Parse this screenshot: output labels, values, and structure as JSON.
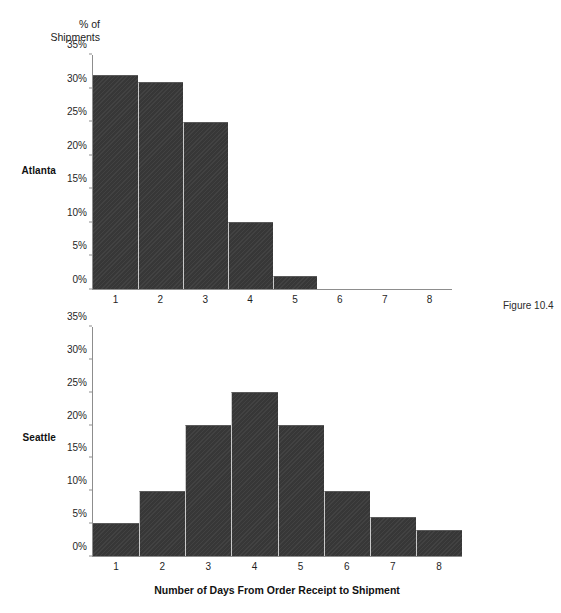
{
  "figure": {
    "caption": "Figure 10.4",
    "y_axis_title": "% of\nShipments",
    "x_axis_title": "Number of Days From Order Receipt to Shipment",
    "bar_color": "#3a3a3a",
    "axis_color": "#8d8d8d",
    "background": "#ffffff"
  },
  "panels": [
    {
      "label": "Atlanta"
    },
    {
      "label": "Seattle"
    }
  ],
  "chart_data": [
    {
      "type": "bar",
      "title": "Atlanta",
      "xlabel": "Number of Days From Order Receipt to Shipment",
      "ylabel": "% of Shipments",
      "categories": [
        "1",
        "2",
        "3",
        "4",
        "5",
        "6",
        "7",
        "8"
      ],
      "values": [
        32,
        31,
        25,
        10,
        2,
        0,
        0,
        0
      ],
      "ylim": [
        0,
        35
      ],
      "ytick_labels": [
        "0%",
        "5%",
        "10%",
        "15%",
        "20%",
        "25%",
        "30%",
        "35%"
      ],
      "ytick_values": [
        0,
        5,
        10,
        15,
        20,
        25,
        30,
        35
      ],
      "grid": false,
      "legend": "none"
    },
    {
      "type": "bar",
      "title": "Seattle",
      "xlabel": "Number of Days From Order Receipt to Shipment",
      "ylabel": "% of Shipments",
      "categories": [
        "1",
        "2",
        "3",
        "4",
        "5",
        "6",
        "7",
        "8"
      ],
      "values": [
        5,
        10,
        20,
        25,
        20,
        10,
        6,
        4
      ],
      "ylim": [
        0,
        35
      ],
      "ytick_labels": [
        "0%",
        "5%",
        "10%",
        "15%",
        "20%",
        "25%",
        "30%",
        "35%"
      ],
      "ytick_values": [
        0,
        5,
        10,
        15,
        20,
        25,
        30,
        35
      ],
      "grid": false,
      "legend": "none"
    }
  ]
}
